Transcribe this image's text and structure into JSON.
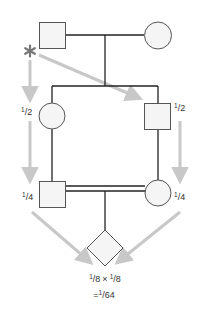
{
  "diagram": {
    "type": "pedigree",
    "colors": {
      "line": "#222222",
      "symbol_stroke": "#555555",
      "symbol_fill": "#f5f5f5",
      "arrow": "#c8c8c8",
      "asterisk": "#777777",
      "text": "#333333"
    },
    "marker": {
      "symbol": "*",
      "meaning": "ancestral allele"
    },
    "individuals": [
      {
        "id": "gen1-male",
        "shape": "square",
        "generation": 1
      },
      {
        "id": "gen1-female",
        "shape": "circle",
        "generation": 1
      },
      {
        "id": "gen2-female",
        "shape": "circle",
        "generation": 2
      },
      {
        "id": "gen2-male",
        "shape": "square",
        "generation": 2
      },
      {
        "id": "gen3-male",
        "shape": "square",
        "generation": 3
      },
      {
        "id": "gen3-female",
        "shape": "circle",
        "generation": 3
      },
      {
        "id": "gen4-offspring",
        "shape": "diamond",
        "generation": 4
      }
    ],
    "labels": {
      "left_gen2": {
        "num": "1",
        "den": "2"
      },
      "right_gen2": {
        "num": "1",
        "den": "2"
      },
      "left_gen3": {
        "num": "1",
        "den": "4"
      },
      "right_gen3": {
        "num": "1",
        "den": "4"
      }
    },
    "result": {
      "line1": {
        "a_num": "1",
        "a_den": "8",
        "op": "×",
        "b_num": "1",
        "b_den": "8"
      },
      "line2": {
        "prefix": "=",
        "num": "1",
        "den": "64"
      }
    }
  }
}
